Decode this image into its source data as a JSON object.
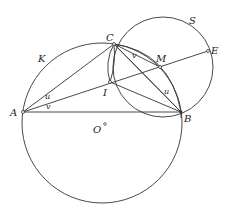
{
  "diagram": {
    "title": "",
    "circles": [
      {
        "name": "K",
        "center": [
          102,
          123
        ],
        "r": 80
      },
      {
        "name": "S",
        "center": [
          163,
          67
        ],
        "r": 50
      }
    ],
    "points": {
      "A": {
        "label": "A",
        "x": 23,
        "y": 112
      },
      "B": {
        "label": "B",
        "x": 181,
        "y": 112
      },
      "C": {
        "label": "C",
        "x": 114,
        "y": 44
      },
      "I": {
        "label": "I",
        "x": 110,
        "y": 82
      },
      "M": {
        "label": "M",
        "x": 160,
        "y": 67
      },
      "E": {
        "label": "E",
        "x": 208,
        "y": 51
      },
      "O": {
        "label": "O",
        "x": 104,
        "y": 125
      }
    },
    "circle_labels": {
      "K": "K",
      "S": "S"
    },
    "angle_labels": {
      "u_at_A": "u",
      "v_at_A": "v",
      "v_at_C": "v",
      "u_at_B": "u"
    },
    "segments": [
      "AB",
      "AC",
      "AE",
      "CB",
      "IB",
      "CM"
    ]
  }
}
